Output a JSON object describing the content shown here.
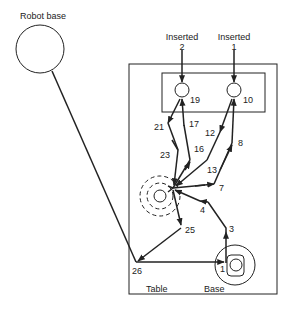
{
  "diagram": {
    "robot_base": {
      "label": "Robot base"
    },
    "inserted": [
      {
        "label": "Inserted",
        "number": "2"
      },
      {
        "label": "Inserted",
        "number": "1"
      }
    ],
    "fixtures": {
      "table_label": "Table",
      "base_label": "Base"
    },
    "points": {
      "p1": "1",
      "p3": "3",
      "p4": "4",
      "p7": "7",
      "p8": "8",
      "p10": "10",
      "p12": "12",
      "p13": "13",
      "p16": "16",
      "p17": "17",
      "p19": "19",
      "p21": "21",
      "p23": "23",
      "p25": "25",
      "p26": "26"
    },
    "colors": {
      "line": "#222222",
      "background": "#ffffff"
    }
  }
}
